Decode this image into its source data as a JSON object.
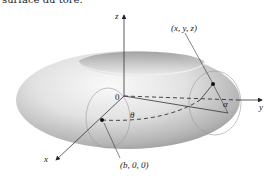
{
  "caption": "surface du tore.",
  "axes": {
    "x_label": "x",
    "y_label": "y",
    "z_label": "z",
    "origin_label": "0"
  },
  "points": {
    "surface_point": {
      "label": "(x, y, z)"
    },
    "center_point": {
      "label": "(b, 0, 0)"
    }
  },
  "angles": {
    "theta": "θ",
    "alpha": "α"
  },
  "colors": {
    "torus_light": "#f4f4f4",
    "torus_mid": "#c8c8c8",
    "torus_dark": "#8a8a8a",
    "line": "#333333"
  }
}
